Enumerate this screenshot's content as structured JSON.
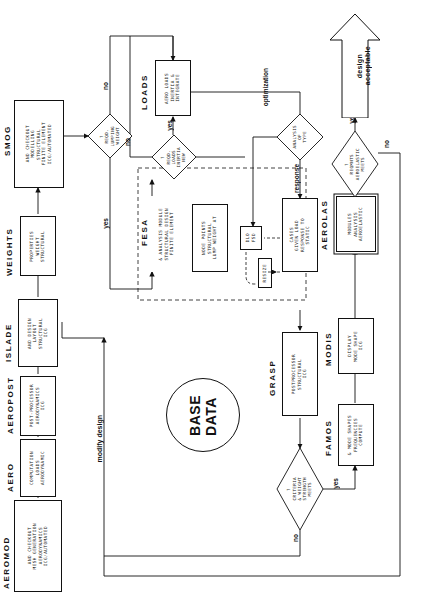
{
  "diagram": {
    "orientation": "rotated-90-ccw",
    "database": {
      "line1": "DATA",
      "line2": "BASE",
      "name": "DATA BASE"
    },
    "modules": [
      {
        "id": "aeromod",
        "title": "AEROMOD",
        "lines": [
          "ICG/AUTOMATED",
          "AERODYNAMICS",
          "MESH GENERATION",
          "AND CHECKOUT"
        ]
      },
      {
        "id": "aero",
        "title": "AERO",
        "lines": [
          "AERODYNAMIC",
          "LOADS",
          "COMPUTATION"
        ]
      },
      {
        "id": "aeropost",
        "title": "AEROPOST",
        "lines": [
          "ICG",
          "AERODYNAMICS",
          "POST-PROCESSOR"
        ]
      },
      {
        "id": "islade",
        "title": "ISLADE",
        "lines": [
          "ICG",
          "STRUCTURAL",
          "LAYOUT",
          "AND DESIGN"
        ]
      },
      {
        "id": "weights",
        "title": "WEIGHTS",
        "lines": [
          "STRUCTURAL",
          "WEIGHT",
          "PROPERTIES"
        ]
      },
      {
        "id": "smog",
        "title": "SMOG",
        "lines": [
          "ICG/AUTOMATED",
          "FINITE ELEMENT",
          "STRUCTURAL",
          "MODELLING",
          "AND CHECKOUT"
        ]
      },
      {
        "id": "loads",
        "title": "LOADS",
        "lines": [
          "INTEGRATE",
          "INERTIA &",
          "AERO LOADS"
        ]
      },
      {
        "id": "fesa",
        "title": "FESA",
        "lines": [
          "FINITE ELEMENT",
          "STRUCTURAL DESIGN",
          "& ANALYSIS MODULE"
        ]
      },
      {
        "id": "lumpweight",
        "title": "",
        "lines": [
          "LUMP WEIGHT AT",
          "STRUCTURAL",
          "NODE POINTS"
        ]
      },
      {
        "id": "fsddlo",
        "title": "",
        "lines": [
          "FSD",
          "DLO"
        ]
      },
      {
        "id": "resize",
        "title": "",
        "lines": [
          "RESIZE"
        ]
      },
      {
        "id": "static",
        "title": "",
        "lines": [
          "STATIC",
          "RESPONSE TO",
          "GIVEN LOAD",
          "CASES"
        ]
      },
      {
        "id": "grasp",
        "title": "GRASP",
        "lines": [
          "ICG",
          "STRUCTURAL",
          "POSTPROCESSOR"
        ]
      },
      {
        "id": "famos",
        "title": "FAMOS",
        "lines": [
          "COMPUTE",
          "FREQUENCIES",
          "& MODE SHAPES"
        ]
      },
      {
        "id": "modis",
        "title": "MODIS",
        "lines": [
          "ICG",
          "MODE SHAPE",
          "DISPLAY"
        ]
      },
      {
        "id": "aerolas",
        "title": "AEROLAS",
        "lines": [
          "AEROELASTIC",
          "ANALYSIS",
          "MODULES"
        ]
      }
    ],
    "decisions": [
      {
        "id": "weight-lumping",
        "lines": [
          "WEIGHT",
          "LUMPING",
          "REQD.",
          "?"
        ]
      },
      {
        "id": "new-inertia-loads",
        "lines": [
          "NEW",
          "INERTIA",
          "LOADS",
          "REQD.",
          "?"
        ]
      },
      {
        "id": "type-of-analysis",
        "lines": [
          "TYPE",
          "OF",
          "ANALYSIS"
        ]
      },
      {
        "id": "meets-strength-weight",
        "lines": [
          "MEETS",
          "STRENGTH",
          "& WEIGHT",
          "CRITERIA",
          "?"
        ]
      },
      {
        "id": "meets-aeroelastic",
        "lines": [
          "MEETS",
          "AEROELASTIC",
          "REQMNTS",
          "?"
        ]
      }
    ],
    "edge_labels": [
      {
        "id": "weight-lumping-no",
        "text": "no"
      },
      {
        "id": "weight-lumping-yes",
        "text": "yes"
      },
      {
        "id": "inertia-no",
        "text": "no"
      },
      {
        "id": "inertia-yes",
        "text": "yes"
      },
      {
        "id": "analysis-optimization",
        "text": "optimization"
      },
      {
        "id": "analysis-response",
        "text": "response"
      },
      {
        "id": "strength-no",
        "text": "no"
      },
      {
        "id": "strength-yes",
        "text": "yes"
      },
      {
        "id": "aeroelastic-no",
        "text": "no"
      },
      {
        "id": "aeroelastic-yes",
        "text": "yes"
      },
      {
        "id": "modify-design",
        "text": "modify design"
      }
    ],
    "terminator": {
      "id": "acceptable-design",
      "line1": "acceptable",
      "line2": "design"
    },
    "colors": {
      "line": "#111111",
      "background": "#ffffff"
    }
  }
}
